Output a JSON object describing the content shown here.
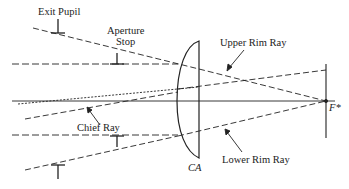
{
  "diagram": {
    "labels": {
      "exit_pupil": "Exit Pupil",
      "aperture_stop_line1": "Aperture",
      "aperture_stop_line2": "Stop",
      "upper_rim_ray": "Upper Rim Ray",
      "chief_ray": "Chief Ray",
      "lower_rim_ray": "Lower Rim Ray",
      "clear_aperture": "CA",
      "focal_point": "F*"
    },
    "colors": {
      "line": "#222222",
      "background": "#ffffff"
    }
  }
}
